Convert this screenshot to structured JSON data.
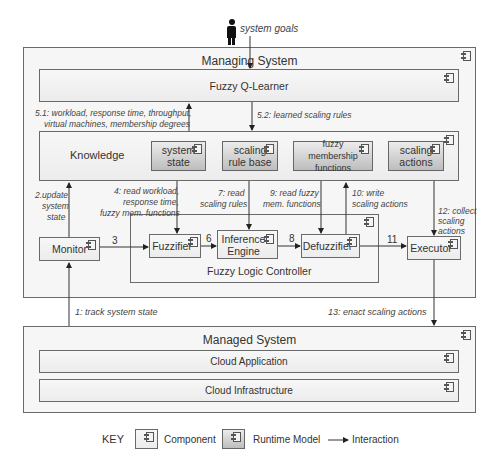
{
  "actor": {
    "label": "system goals",
    "icon": "person-icon"
  },
  "managing_system": {
    "title": "Managing System",
    "q_learner": "Fuzzy Q-Learner",
    "knowledge": {
      "title": "Knowledge",
      "models": [
        "system state",
        "scaling rule base",
        "fuzzy membership functions",
        "scaling actions"
      ]
    },
    "monitor": "Monitor",
    "flc": {
      "title": "Fuzzy Logic Controller",
      "fuzzifier": "Fuzzifier",
      "inference": "Inference Engine",
      "defuzzifier": "Defuzzifier"
    },
    "executor": "Executor"
  },
  "managed_system": {
    "title": "Managed System",
    "layers": [
      "Cloud Application",
      "Cloud Infrastructure"
    ]
  },
  "interactions": {
    "i1": "1: track system state",
    "i2a": "2.update",
    "i2b": "system",
    "i2c": "state",
    "i3": "3",
    "i4a": "4: read workload,",
    "i4b": "response time,",
    "i4c": "fuzzy mem. functions",
    "i51a": "5.1: workload, response time, throughput,",
    "i51b": "virtual machines, membership degrees",
    "i52": "5.2: learned scaling rules",
    "i6": "6",
    "i7a": "7: read",
    "i7b": "scaling rules",
    "i8": "8",
    "i9a": "9: read fuzzy",
    "i9b": "mem. functions",
    "i10a": "10: write",
    "i10b": "scaling actions",
    "i11": "11",
    "i12a": "12: collect",
    "i12b": "scaling",
    "i12c": "actions",
    "i13": "13: enact scaling actions"
  },
  "key": {
    "title": "KEY",
    "component": "Component",
    "runtime_model": "Runtime Model",
    "interaction": "Interaction"
  }
}
